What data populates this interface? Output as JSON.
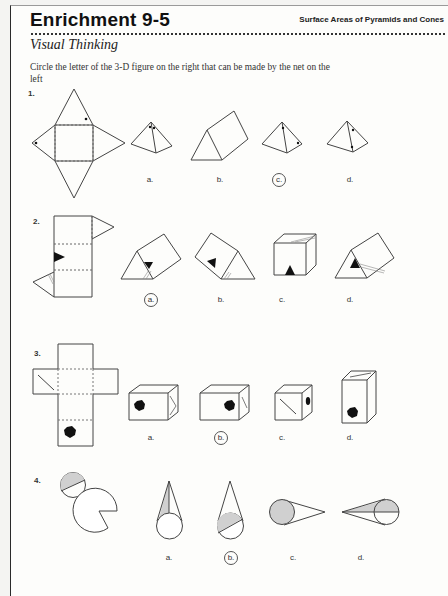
{
  "header": {
    "title": "Enrichment 9-5",
    "topic": "Surface Areas of Pyramids and Cones"
  },
  "section": {
    "title": "Visual Thinking",
    "instructions": "Circle the letter of the 3-D figure on the right that can be made by the net on the left"
  },
  "questions": [
    {
      "number": "1.",
      "net": "square-pyramid-net-with-dots",
      "options": [
        {
          "label": "a.",
          "figure": "square-pyramid-dots-at-apex",
          "circled": false
        },
        {
          "label": "b.",
          "figure": "triangular-prism",
          "circled": false
        },
        {
          "label": "c.",
          "figure": "square-pyramid-dots-upper-and-right",
          "circled": true
        },
        {
          "label": "d.",
          "figure": "square-pyramid-dots-upper-and-lower",
          "circled": false
        }
      ],
      "answer": "c"
    },
    {
      "number": "2.",
      "net": "triangular-prism-net-with-black-triangle",
      "options": [
        {
          "label": "a.",
          "figure": "prism-triangle-on-end-face",
          "circled": true
        },
        {
          "label": "b.",
          "figure": "prism-triangle-on-side-face",
          "circled": false
        },
        {
          "label": "c.",
          "figure": "cube-with-triangle",
          "circled": false
        },
        {
          "label": "d.",
          "figure": "prism-triangle-on-end-face-lines-on-side",
          "circled": false
        }
      ],
      "answer": "a"
    },
    {
      "number": "3.",
      "net": "rectangular-prism-net-with-hexagon-and-diagonal",
      "options": [
        {
          "label": "a.",
          "figure": "box-hexagon-left",
          "circled": false
        },
        {
          "label": "b.",
          "figure": "box-hexagon-right",
          "circled": true
        },
        {
          "label": "c.",
          "figure": "cube-diagonal-front-hexagon-side",
          "circled": false
        },
        {
          "label": "d.",
          "figure": "tall-box-hexagon-front",
          "circled": false
        }
      ],
      "answer": "b"
    },
    {
      "number": "4.",
      "net": "cone-net-sector-and-half-shaded-circle",
      "options": [
        {
          "label": "a.",
          "figure": "cone-shaded-lateral-sliver",
          "circled": false
        },
        {
          "label": "b.",
          "figure": "cone-half-shaded-base",
          "circled": true
        },
        {
          "label": "c.",
          "figure": "cone-fully-shaded-base",
          "circled": false
        },
        {
          "label": "d.",
          "figure": "cone-shaded-upper-half",
          "circled": false
        }
      ],
      "answer": "b"
    }
  ],
  "colors": {
    "ink": "#333333",
    "shade": "#cfcfcf",
    "fill_black": "#111111"
  }
}
